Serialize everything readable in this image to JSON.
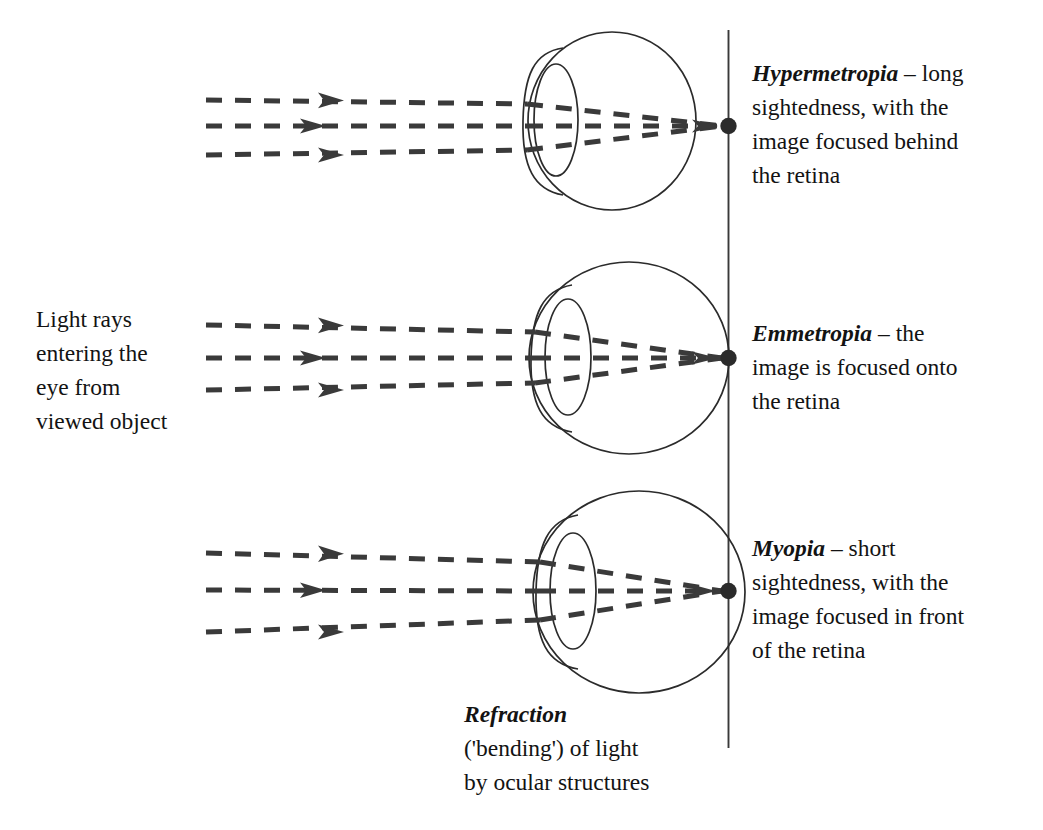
{
  "diagram": {
    "colors": {
      "ink": "#131313",
      "outline": "#2b2b2b",
      "ray": "#3a3a3a",
      "background": "#ffffff"
    },
    "reference_line_name": "retinal plane reference line"
  },
  "labels": {
    "light_source": {
      "lines": [
        "Light rays",
        "entering the",
        "eye from",
        "viewed object"
      ]
    },
    "refraction": {
      "lead": "Refraction",
      "lines": [
        "('bending') of light",
        "by ocular structures"
      ]
    }
  },
  "conditions": [
    {
      "id": "hypermetropia",
      "lead": "Hypermetropia",
      "lines": [
        " – long",
        "sightedness, with the",
        "image focused behind",
        "the retina"
      ],
      "focus_position": "behind the retina"
    },
    {
      "id": "emmetropia",
      "lead": "Emmetropia",
      "lines": [
        " – the",
        "image is focused onto",
        "the retina"
      ],
      "focus_position": "onto the retina"
    },
    {
      "id": "myopia",
      "lead": "Myopia",
      "lines": [
        " – short",
        "sightedness, with the",
        "image focused in front",
        "of the retina"
      ],
      "focus_position": "in front of the retina"
    }
  ],
  "eyes": [
    {
      "id": "eye-hypermetropia",
      "ray_count": 3,
      "eyeball_size": "small",
      "focal_point_on_reference_line": true
    },
    {
      "id": "eye-emmetropia",
      "ray_count": 3,
      "eyeball_size": "medium",
      "focal_point_on_reference_line": true
    },
    {
      "id": "eye-myopia",
      "ray_count": 3,
      "eyeball_size": "large",
      "focal_point_on_reference_line": true
    }
  ]
}
